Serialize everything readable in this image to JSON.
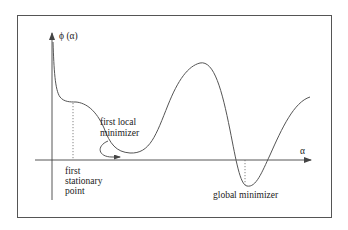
{
  "figure": {
    "y_axis_label": "ϕ (α)",
    "x_axis_label": "α",
    "annotations": {
      "first_local_minimizer": [
        "first local",
        "minimizer"
      ],
      "first_stationary_point": [
        "first",
        "stationary",
        "point"
      ],
      "global_minimizer": "global minimizer"
    },
    "colors": {
      "curve": "#555555",
      "axis": "#444444",
      "frame": "#555555",
      "text": "#222222",
      "background": "#ffffff"
    }
  }
}
